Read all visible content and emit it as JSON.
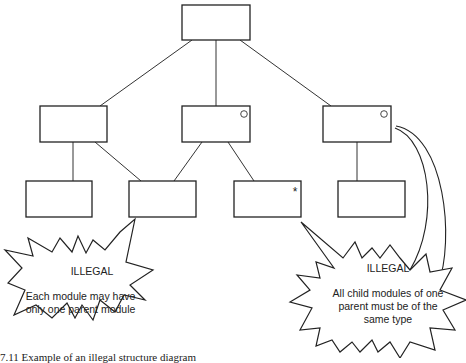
{
  "diagram": {
    "type": "module-hierarchy",
    "nodes": [
      {
        "id": "root",
        "marker": ""
      },
      {
        "id": "mid-left",
        "marker": ""
      },
      {
        "id": "mid-center",
        "marker": "circle"
      },
      {
        "id": "mid-right",
        "marker": "circle"
      },
      {
        "id": "bottom-1",
        "marker": ""
      },
      {
        "id": "bottom-2",
        "marker": ""
      },
      {
        "id": "bottom-3",
        "marker": "asterisk"
      },
      {
        "id": "bottom-4",
        "marker": ""
      }
    ],
    "marker_glyphs": {
      "circle": "○",
      "asterisk": "*"
    },
    "callouts": {
      "left": {
        "heading": "ILLEGAL",
        "line1": "Each module may have",
        "line2": "only one parent module"
      },
      "right": {
        "heading": "ILLEGAL",
        "line1": "All child modules of one",
        "line2": "parent must be of the",
        "line3": "same type"
      }
    },
    "caption": "7.11 Example of an illegal structure diagram"
  }
}
